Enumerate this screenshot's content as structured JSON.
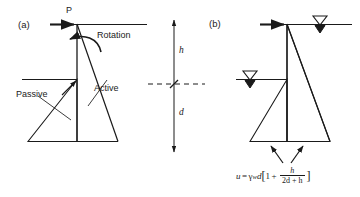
{
  "figure": {
    "panels": [
      {
        "tag": "(a)",
        "name": "earth-pressure-panel",
        "labels": {
          "force": "P",
          "rotation": "Rotation",
          "passive": "Passive",
          "active": "Active"
        }
      },
      {
        "tag": "(b)",
        "name": "water-pressure-panel",
        "labels": {
          "water_table_top": "water-table-symbol-top",
          "water_table_bottom": "water-table-symbol-bottom"
        }
      }
    ],
    "dimensions": {
      "above_excavation": "h",
      "below_excavation": "d"
    },
    "equation": {
      "lhs": "u",
      "equals": "=",
      "gamma": "γ",
      "gamma_sub": "w",
      "depth": "d",
      "bracket_open": "[",
      "one": "1",
      "plus": "+",
      "frac_num": "h",
      "frac_den": "2d + h",
      "bracket_close": "]",
      "plain": "u = γwd[1 + h/(2d + h)]"
    },
    "colors": {
      "ink": "#1a1a1a",
      "background": "#ffffff"
    }
  }
}
